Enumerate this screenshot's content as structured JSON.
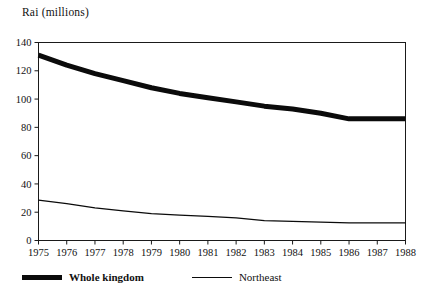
{
  "chart_data": {
    "type": "line",
    "title": "",
    "ylabel": "Rai (millions)",
    "xlabel": "",
    "x": [
      1975,
      1976,
      1977,
      1978,
      1979,
      1980,
      1981,
      1982,
      1983,
      1984,
      1985,
      1986,
      1987,
      1988
    ],
    "categories": [
      "1975",
      "1976",
      "1977",
      "1978",
      "1979",
      "1980",
      "1981",
      "1982",
      "1983",
      "1984",
      "1985",
      "1986",
      "1987",
      "1988"
    ],
    "series": [
      {
        "name": "Whole kingdom",
        "style": "thick",
        "color": "#0b0b0b",
        "values": [
          131,
          124,
          118,
          113,
          108,
          104,
          101,
          98,
          95,
          93,
          90,
          86,
          86,
          86
        ]
      },
      {
        "name": "Northeast",
        "style": "thin",
        "color": "#0b0b0b",
        "values": [
          28.5,
          26,
          23,
          21,
          19,
          18,
          17,
          16,
          14,
          13.5,
          13,
          12.5,
          12.5,
          12.5
        ]
      }
    ],
    "ylim": [
      0,
      140
    ],
    "yticks": [
      0,
      20,
      40,
      60,
      80,
      100,
      120,
      140
    ],
    "ytick_labels": [
      "0",
      "20",
      "40",
      "60",
      "80",
      "100",
      "120",
      "140"
    ],
    "xlim": [
      1975,
      1988
    ],
    "grid": false,
    "legend_position": "bottom-left",
    "legend": [
      {
        "label": "Whole kingdom",
        "style": "thick"
      },
      {
        "label": "Northeast",
        "style": "thin"
      }
    ]
  }
}
